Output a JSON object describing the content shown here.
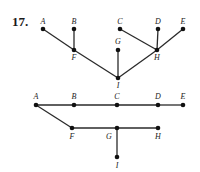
{
  "problem_number": "17.",
  "graphs": [
    {
      "name": "graph-1",
      "nodes": [
        {
          "id": "A",
          "x": 43,
          "y": 29,
          "lx": 43,
          "ly": 24
        },
        {
          "id": "B",
          "x": 74,
          "y": 29,
          "lx": 74,
          "ly": 24
        },
        {
          "id": "C",
          "x": 120,
          "y": 29,
          "lx": 120,
          "ly": 24
        },
        {
          "id": "D",
          "x": 158,
          "y": 29,
          "lx": 158,
          "ly": 24
        },
        {
          "id": "E",
          "x": 183,
          "y": 29,
          "lx": 183,
          "ly": 24
        },
        {
          "id": "F",
          "x": 74,
          "y": 50,
          "lx": 74,
          "ly": 60
        },
        {
          "id": "G",
          "x": 118,
          "y": 50,
          "lx": 118,
          "ly": 44
        },
        {
          "id": "H",
          "x": 157,
          "y": 50,
          "lx": 157,
          "ly": 60
        },
        {
          "id": "I",
          "x": 118,
          "y": 78,
          "lx": 118,
          "ly": 88
        }
      ],
      "edges": [
        [
          "A",
          "F"
        ],
        [
          "B",
          "F"
        ],
        [
          "F",
          "I"
        ],
        [
          "G",
          "I"
        ],
        [
          "I",
          "H"
        ],
        [
          "C",
          "H"
        ],
        [
          "D",
          "H"
        ],
        [
          "E",
          "H"
        ]
      ]
    },
    {
      "name": "graph-2",
      "nodes": [
        {
          "id": "A",
          "x": 36,
          "y": 105,
          "lx": 36,
          "ly": 99
        },
        {
          "id": "B",
          "x": 74,
          "y": 105,
          "lx": 74,
          "ly": 99
        },
        {
          "id": "C",
          "x": 117,
          "y": 105,
          "lx": 117,
          "ly": 99
        },
        {
          "id": "D",
          "x": 158,
          "y": 105,
          "lx": 158,
          "ly": 99
        },
        {
          "id": "E",
          "x": 183,
          "y": 105,
          "lx": 183,
          "ly": 99
        },
        {
          "id": "F",
          "x": 72,
          "y": 128,
          "lx": 72,
          "ly": 139
        },
        {
          "id": "G",
          "x": 117,
          "y": 128,
          "lx": 109,
          "ly": 139
        },
        {
          "id": "H",
          "x": 158,
          "y": 128,
          "lx": 158,
          "ly": 139
        },
        {
          "id": "I",
          "x": 117,
          "y": 157,
          "lx": 117,
          "ly": 168
        }
      ],
      "edges": [
        [
          "A",
          "B"
        ],
        [
          "B",
          "C"
        ],
        [
          "C",
          "D"
        ],
        [
          "D",
          "E"
        ],
        [
          "A",
          "F"
        ],
        [
          "F",
          "G"
        ],
        [
          "G",
          "H"
        ],
        [
          "G",
          "I"
        ]
      ]
    }
  ]
}
